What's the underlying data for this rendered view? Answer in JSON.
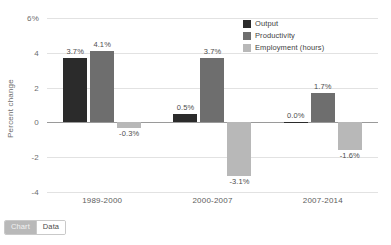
{
  "chart_data": {
    "type": "bar",
    "title": "",
    "xlabel": "",
    "ylabel": "Percent change",
    "categories": [
      "1989-2000",
      "2000-2007",
      "2007-2014"
    ],
    "ylim": [
      -4,
      6
    ],
    "yticks": [
      6,
      4,
      2,
      0,
      -2,
      -4
    ],
    "ytick_labels": [
      "6%",
      "4",
      "2",
      "0",
      "-2",
      "-4"
    ],
    "grid": true,
    "legend_position": "top-right",
    "series": [
      {
        "name": "Output",
        "color": "#2b2b2b",
        "values": [
          3.7,
          0.5,
          0.0
        ],
        "labels": [
          "3.7%",
          "0.5%",
          "0.0%"
        ]
      },
      {
        "name": "Productivity",
        "color": "#6e6e6e",
        "values": [
          4.1,
          3.7,
          1.7
        ],
        "labels": [
          "4.1%",
          "3.7%",
          "1.7%"
        ]
      },
      {
        "name": "Employment (hours)",
        "color": "#b8b8b8",
        "values": [
          -0.3,
          -3.1,
          -1.6
        ],
        "labels": [
          "-0.3%",
          "-3.1%",
          "-1.6%"
        ]
      }
    ]
  },
  "legend": {
    "items": [
      {
        "label": "Output",
        "color": "#2b2b2b"
      },
      {
        "label": "Productivity",
        "color": "#6e6e6e"
      },
      {
        "label": "Employment (hours)",
        "color": "#b8b8b8"
      }
    ]
  },
  "toggle": {
    "chart_label": "Chart",
    "data_label": "Data",
    "active": "Chart"
  }
}
